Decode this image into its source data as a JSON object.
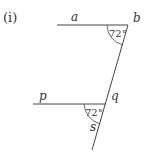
{
  "figure_label": "(i)",
  "colors": {
    "line": "#444444",
    "text": "#333333",
    "background": "#ffffff"
  },
  "top_line": {
    "left_label": "a",
    "right_label": "b",
    "angle": "72°"
  },
  "bottom_line": {
    "left_label": "p",
    "angle": "72°"
  },
  "transversal": {
    "upper_label": "q",
    "lower_label": "s"
  }
}
